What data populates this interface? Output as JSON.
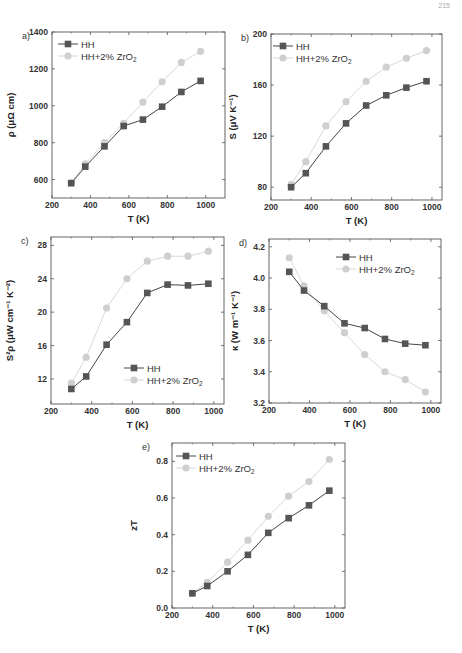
{
  "page_number": "215",
  "colors": {
    "HH": "#555555",
    "HH_line": "#444444",
    "ZrO2": "#cfcfcf",
    "ZrO2_line": "#d8d8d8",
    "frame": "#555555"
  },
  "legend": {
    "series1": "HH",
    "series2": "HH+2% ZrO",
    "series2_sub": "2"
  },
  "chart_data": [
    {
      "id": "a",
      "panel_label": "a)",
      "type": "line",
      "title": "",
      "xlabel": "T (K)",
      "ylabel": "ρ (μΩ cm)",
      "xlim": [
        200,
        1100
      ],
      "ylim": [
        500,
        1400
      ],
      "xticks": [
        200,
        400,
        600,
        800,
        1000
      ],
      "yticks": [
        600,
        800,
        1000,
        1200,
        1400
      ],
      "legend_position": "upper-left",
      "grid": false,
      "x": [
        300,
        373,
        473,
        573,
        673,
        773,
        873,
        973
      ],
      "series": [
        {
          "name": "HH",
          "marker": "square",
          "values": [
            580,
            670,
            780,
            890,
            925,
            995,
            1075,
            1135
          ]
        },
        {
          "name": "HH+2% ZrO2",
          "marker": "circle",
          "values": [
            583,
            685,
            800,
            905,
            1020,
            1130,
            1235,
            1295
          ]
        }
      ]
    },
    {
      "id": "b",
      "panel_label": "b)",
      "type": "line",
      "title": "",
      "xlabel": "T (K)",
      "ylabel": "S (μV K⁻¹)",
      "xlim": [
        200,
        1050
      ],
      "ylim": [
        70,
        200
      ],
      "xticks": [
        200,
        400,
        600,
        800,
        1000
      ],
      "yticks": [
        80,
        120,
        160,
        200
      ],
      "legend_position": "upper-left",
      "grid": false,
      "x": [
        300,
        373,
        473,
        573,
        673,
        773,
        873,
        973
      ],
      "series": [
        {
          "name": "HH",
          "marker": "square",
          "values": [
            80,
            91,
            112,
            130,
            144,
            152,
            158,
            163
          ]
        },
        {
          "name": "HH+2% ZrO2",
          "marker": "circle",
          "values": [
            82,
            100,
            128,
            147,
            163,
            174,
            181,
            187
          ]
        }
      ]
    },
    {
      "id": "c",
      "panel_label": "c)",
      "type": "line",
      "title": "",
      "xlabel": "T (K)",
      "ylabel": "S²ρ (μW cm⁻¹ K⁻²)",
      "xlim": [
        200,
        1050
      ],
      "ylim": [
        9,
        29
      ],
      "xticks": [
        200,
        400,
        600,
        800,
        1000
      ],
      "yticks": [
        12,
        16,
        20,
        24,
        28
      ],
      "legend_position": "lower-right",
      "grid": false,
      "x": [
        300,
        373,
        473,
        573,
        673,
        773,
        873,
        973
      ],
      "series": [
        {
          "name": "HH",
          "marker": "square",
          "values": [
            10.8,
            12.3,
            16.1,
            18.8,
            22.3,
            23.3,
            23.2,
            23.4
          ]
        },
        {
          "name": "HH+2% ZrO2",
          "marker": "circle",
          "values": [
            11.5,
            14.6,
            20.5,
            24.0,
            26.1,
            26.7,
            26.7,
            27.3
          ]
        }
      ]
    },
    {
      "id": "d",
      "panel_label": "d)",
      "type": "line",
      "title": "",
      "xlabel": "T (K)",
      "ylabel": "κ (W m⁻¹ K⁻¹)",
      "xlim": [
        200,
        1050
      ],
      "ylim": [
        3.2,
        4.25
      ],
      "xticks": [
        200,
        400,
        600,
        800,
        1000
      ],
      "yticks": [
        3.2,
        3.4,
        3.6,
        3.8,
        4.0,
        4.2
      ],
      "legend_position": "upper-right",
      "grid": false,
      "x": [
        300,
        373,
        473,
        573,
        673,
        773,
        873,
        973
      ],
      "series": [
        {
          "name": "HH",
          "marker": "square",
          "values": [
            4.04,
            3.92,
            3.82,
            3.71,
            3.68,
            3.61,
            3.58,
            3.57
          ]
        },
        {
          "name": "HH+2% ZrO2",
          "marker": "circle",
          "values": [
            4.13,
            3.95,
            3.79,
            3.65,
            3.51,
            3.4,
            3.35,
            3.27
          ]
        }
      ]
    },
    {
      "id": "e",
      "panel_label": "e)",
      "type": "line",
      "title": "",
      "xlabel": "T (K)",
      "ylabel": "zT",
      "xlim": [
        200,
        1050
      ],
      "ylim": [
        0.0,
        0.9
      ],
      "xticks": [
        200,
        400,
        600,
        800,
        1000
      ],
      "yticks": [
        0.0,
        0.2,
        0.4,
        0.6,
        0.8
      ],
      "legend_position": "upper-left",
      "grid": false,
      "x": [
        300,
        373,
        473,
        573,
        673,
        773,
        873,
        973
      ],
      "series": [
        {
          "name": "HH",
          "marker": "square",
          "values": [
            0.08,
            0.12,
            0.2,
            0.29,
            0.41,
            0.49,
            0.56,
            0.64
          ]
        },
        {
          "name": "HH+2% ZrO2",
          "marker": "circle",
          "values": [
            0.08,
            0.14,
            0.25,
            0.37,
            0.5,
            0.61,
            0.69,
            0.81
          ]
        }
      ]
    }
  ]
}
